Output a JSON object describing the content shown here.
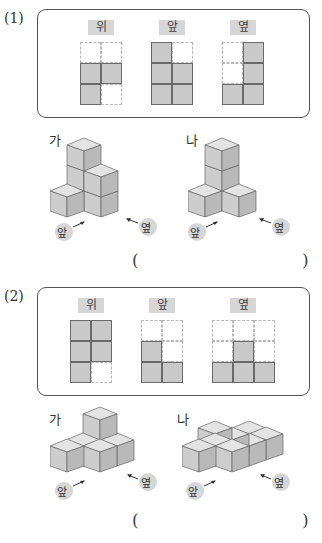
{
  "problems": [
    {
      "number": "(1)",
      "views": [
        {
          "label": "위",
          "cols": 2,
          "rows": 3,
          "filled": [
            [
              0,
              0,
              0
            ],
            [
              1,
              1,
              1
            ],
            [
              1,
              0,
              0
            ]
          ]
        },
        {
          "label": "앞",
          "cols": 2,
          "rows": 3,
          "filled": [
            [
              1,
              0,
              0
            ],
            [
              1,
              1,
              1
            ],
            [
              1,
              1,
              1
            ]
          ]
        },
        {
          "label": "옆",
          "cols": 2,
          "rows": 3,
          "filled": [
            [
              0,
              1,
              0
            ],
            [
              0,
              1,
              1
            ],
            [
              1,
              1,
              1
            ]
          ]
        }
      ],
      "figures": [
        {
          "label": "가",
          "front_tag": "앞",
          "side_tag": "옆"
        },
        {
          "label": "나",
          "front_tag": "앞",
          "side_tag": "옆"
        }
      ],
      "answer_open": "(",
      "answer_close": ")"
    },
    {
      "number": "(2)",
      "views": [
        {
          "label": "위",
          "cols": 2,
          "rows": 3
        },
        {
          "label": "앞",
          "cols": 2,
          "rows": 3
        },
        {
          "label": "옆",
          "cols": 3,
          "rows": 3
        }
      ],
      "figures": [
        {
          "label": "가",
          "front_tag": "앞",
          "side_tag": "옆"
        },
        {
          "label": "나",
          "front_tag": "앞",
          "side_tag": "옆"
        }
      ],
      "answer_open": "(",
      "answer_close": ")"
    }
  ],
  "colors": {
    "cell_fill": "#c9c9c9",
    "cube_top": "#e4e4e4",
    "cube_left": "#cdcdcd",
    "cube_right": "#b9b9b9",
    "tag_bg": "#d6d6d6"
  }
}
